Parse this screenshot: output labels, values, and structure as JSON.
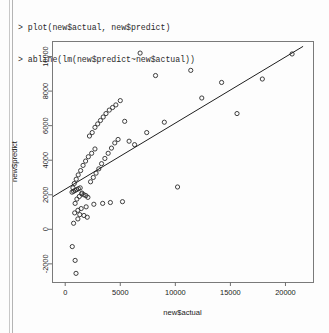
{
  "window": {
    "background_color": "#fdfdfd",
    "edge_rule_color": "#c8c8c8"
  },
  "console": {
    "lines": [
      "> plot(new$actual, new$predict)",
      "> abline(lm(new$predict~new$actual))"
    ],
    "line1": "> plot(new$actual, new$predict)",
    "line2": "> abline(lm(new$predict~new$actual))",
    "prompt": ">"
  },
  "chart_data": {
    "type": "scatter",
    "title": "",
    "xlabel": "new$actual",
    "ylabel": "new$predict",
    "xlim": [
      -1200,
      22500
    ],
    "ylim": [
      -3050,
      10900
    ],
    "xticks": [
      0,
      5000,
      10000,
      15000,
      20000
    ],
    "yticks": [
      -2000,
      0,
      2000,
      4000,
      6000,
      8000,
      10000
    ],
    "xtick_labels": [
      "0",
      "5000",
      "10000",
      "15000",
      "20000"
    ],
    "ytick_labels": [
      "-2000",
      "0",
      "2000",
      "4000",
      "6000",
      "8000",
      "10000"
    ],
    "grid": false,
    "legend": false,
    "point_marker": "open-circle",
    "point_color": "#2b2b2b",
    "line_color": "#1f1f1f",
    "regression_line": {
      "label": "abline(lm(new$predict~new$actual))",
      "intercept": 2320,
      "slope": 0.383,
      "x_start": -1200,
      "y_start": 1860,
      "x_end": 21600,
      "y_end": 10590
    },
    "x": [
      760,
      640,
      900,
      980,
      1150,
      1320,
      900,
      1060,
      1280,
      1500,
      700,
      820,
      1000,
      1180,
      1400,
      1620,
      1850,
      2100,
      2400,
      2700,
      620,
      760,
      900,
      1040,
      1200,
      1360,
      1520,
      1700,
      1880,
      2060,
      2300,
      2550,
      2800,
      3050,
      3300,
      3600,
      3900,
      4200,
      4500,
      4800,
      2200,
      2450,
      2700,
      2950,
      3200,
      3450,
      3700,
      4000,
      4300,
      4600,
      5000,
      5400,
      5800,
      6300,
      6800,
      7400,
      8200,
      9000,
      10200,
      11400,
      12400,
      14200,
      15600,
      17900,
      20600,
      5200,
      4100,
      3400,
      2600,
      1900,
      1450,
      1150,
      860,
      1700,
      2000
    ],
    "y": [
      350,
      -1000,
      -1800,
      -2550,
      600,
      850,
      1500,
      1750,
      1900,
      2050,
      2400,
      2650,
      2900,
      3150,
      3400,
      3700,
      3950,
      4200,
      4400,
      4650,
      2150,
      2200,
      2250,
      2300,
      2350,
      2400,
      2100,
      2000,
      1950,
      1850,
      2750,
      3000,
      3250,
      3500,
      3800,
      4100,
      4400,
      4700,
      5000,
      5200,
      5400,
      5600,
      5900,
      6100,
      6300,
      6500,
      6700,
      6900,
      7050,
      7200,
      7450,
      6250,
      5100,
      4900,
      10200,
      5600,
      8900,
      6200,
      2450,
      9200,
      7600,
      8500,
      6700,
      8700,
      10150,
      1600,
      1550,
      1500,
      1450,
      1300,
      1200,
      1100,
      950,
      800,
      700
    ],
    "n_points": 75
  }
}
